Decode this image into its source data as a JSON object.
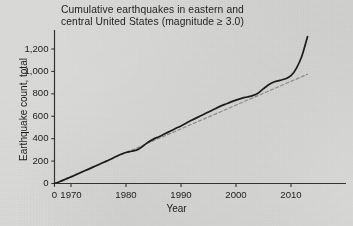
{
  "figure": {
    "title_line1": "Cumulative earthquakes in eastern and",
    "title_line2": "central United States (magnitude ≥ 3.0)",
    "background_color": "#d9d9d8",
    "ink_color": "#1c1c1c",
    "trend_color": "#8a8a8a"
  },
  "chart_data": {
    "type": "line",
    "title": "Cumulative earthquakes in eastern and central United States (magnitude ≥ 3.0)",
    "xlabel": "Year",
    "ylabel": "Earthquake count, total",
    "xlim": [
      1967,
      2014
    ],
    "ylim": [
      0,
      1340
    ],
    "grid": false,
    "legend": null,
    "xticks": [
      0,
      1970,
      1980,
      1990,
      2000,
      2010
    ],
    "xtick_labels": [
      "0",
      "1970",
      "1980",
      "1990",
      "2000",
      "2010"
    ],
    "yticks": [
      0,
      200,
      400,
      600,
      800,
      1000,
      1200
    ],
    "ytick_labels": [
      "0",
      "200",
      "400",
      "600",
      "800",
      "1,000",
      "1,200"
    ],
    "series": [
      {
        "name": "Cumulative earthquake count",
        "style": "solid",
        "color": "#1c1c1c",
        "x": [
          1967,
          1968,
          1969,
          1970,
          1971,
          1972,
          1973,
          1974,
          1975,
          1976,
          1977,
          1978,
          1979,
          1980,
          1981,
          1982,
          1983,
          1984,
          1985,
          1986,
          1987,
          1988,
          1989,
          1990,
          1991,
          1992,
          1993,
          1994,
          1995,
          1996,
          1997,
          1998,
          1999,
          2000,
          2001,
          2002,
          2003,
          2004,
          2005,
          2006,
          2007,
          2008,
          2009,
          2010,
          2011,
          2012,
          2013
        ],
        "values": [
          0,
          18,
          38,
          58,
          80,
          102,
          124,
          146,
          168,
          190,
          212,
          236,
          258,
          276,
          288,
          300,
          330,
          368,
          396,
          418,
          442,
          466,
          490,
          514,
          540,
          566,
          590,
          614,
          638,
          662,
          686,
          706,
          726,
          744,
          760,
          772,
          784,
          806,
          846,
          884,
          908,
          920,
          934,
          962,
          1030,
          1140,
          1310
        ]
      },
      {
        "name": "Linear trend",
        "style": "dashed",
        "color": "#8a8a8a",
        "x": [
          1967,
          2013
        ],
        "values": [
          0,
          975
        ]
      }
    ],
    "annotations": [
      {
        "text": "Sharp upturn after 2009",
        "x": 2011,
        "y": 1100
      }
    ]
  },
  "axes": {
    "x_title": "Year",
    "y_title": "Earthquake count, total"
  }
}
